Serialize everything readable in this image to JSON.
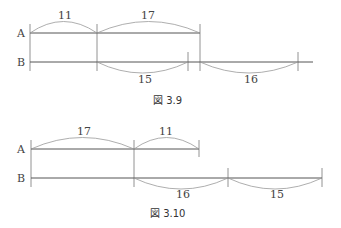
{
  "figures": [
    {
      "caption": "図 3.9",
      "rows": [
        {
          "label": "A",
          "segments": [
            {
              "value": "11"
            },
            {
              "value": "17"
            }
          ]
        },
        {
          "label": "B",
          "segments": [
            {
              "value": "15"
            },
            {
              "value": "16"
            }
          ]
        }
      ]
    },
    {
      "caption": "図 3.10",
      "rows": [
        {
          "label": "A",
          "segments": [
            {
              "value": "17"
            },
            {
              "value": "11"
            }
          ]
        },
        {
          "label": "B",
          "segments": [
            {
              "value": "16"
            },
            {
              "value": "15"
            }
          ]
        }
      ]
    }
  ]
}
